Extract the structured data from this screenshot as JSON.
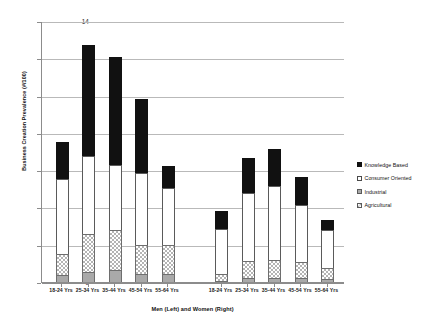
{
  "chart_data": {
    "type": "bar",
    "stacked": true,
    "title": "",
    "xlabel": "Men (Left) and Women (Right)",
    "ylabel": "Business Creation Prevalence (#/100)",
    "ylim": [
      0,
      14
    ],
    "yticks": [
      0,
      2,
      4,
      6,
      8,
      10,
      12,
      14
    ],
    "grid": true,
    "legend_position": "right",
    "groups": [
      "Men",
      "Women"
    ],
    "categories": [
      "18-24 Yrs",
      "25-34 Yrs",
      "35-44 Yrs",
      "45-54 Yrs",
      "55-64 Yrs",
      "18-24 Yrs",
      "25-34 Yrs",
      "35-44 Yrs",
      "45-54 Yrs",
      "55-64 Yrs"
    ],
    "series": [
      {
        "name": "Industrial",
        "color": "#a9a9a9",
        "values": [
          0.35,
          0.55,
          0.65,
          0.45,
          0.45,
          0.05,
          0.2,
          0.2,
          0.2,
          0.15
        ]
      },
      {
        "name": "Agricultural",
        "color": "#b4b4b4",
        "values": [
          1.15,
          2.05,
          2.15,
          1.55,
          1.55,
          0.35,
          0.95,
          1.0,
          0.9,
          0.6
        ]
      },
      {
        "name": "Consumer Oriented",
        "color": "#ffffff",
        "values": [
          4.05,
          4.15,
          3.5,
          3.85,
          3.05,
          2.45,
          3.65,
          3.95,
          3.05,
          2.05
        ]
      },
      {
        "name": "Knowledge Based",
        "color": "#111111",
        "values": [
          1.95,
          5.95,
          5.75,
          3.95,
          1.15,
          0.95,
          1.85,
          2.0,
          1.5,
          0.55
        ]
      }
    ],
    "totals": [
      7.5,
      12.7,
      12.05,
      9.8,
      6.2,
      3.8,
      6.65,
      7.15,
      5.65,
      3.35
    ]
  },
  "legend": {
    "items": [
      {
        "label": "Knowledge Based",
        "swatch": "black-square"
      },
      {
        "label": "Consumer Oriented",
        "swatch": "white-square"
      },
      {
        "label": "Industrial",
        "swatch": "grey-square"
      },
      {
        "label": "Agricultural",
        "swatch": "checker-square"
      }
    ]
  }
}
